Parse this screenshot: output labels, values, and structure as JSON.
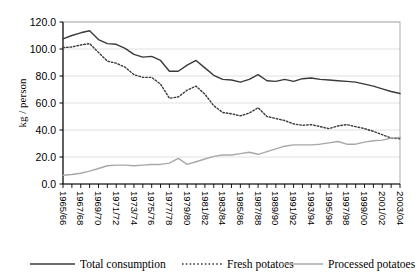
{
  "chart_data": {
    "type": "line",
    "title": "",
    "xlabel": "",
    "ylabel": "kg / person",
    "ylim": [
      0,
      120
    ],
    "ytick_values": [
      0,
      20,
      40,
      60,
      80,
      100,
      120
    ],
    "ytick_labels": [
      "0.0",
      "20.0",
      "40.0",
      "60.0",
      "80.0",
      "100.0",
      "120.0"
    ],
    "grid": true,
    "legend_position": "bottom",
    "x": [
      "1965/66",
      "1966/67",
      "1967/68",
      "1968/69",
      "1969/70",
      "1970/71",
      "1971/72",
      "1972/73",
      "1973/74",
      "1974/75",
      "1975/76",
      "1976/77",
      "1977/78",
      "1978/79",
      "1979/80",
      "1980/81",
      "1981/82",
      "1982/83",
      "1983/84",
      "1984/85",
      "1985/86",
      "1986/87",
      "1987/88",
      "1988/89",
      "1989/90",
      "1990/91",
      "1991/92",
      "1992/93",
      "1993/94",
      "1994/95",
      "1995/96",
      "1996/97",
      "1997/98",
      "1998/99",
      "1999/00",
      "2000/01",
      "2001/02",
      "2002/03",
      "2003/04"
    ],
    "xtick_labels": [
      "1965/66",
      "1967/68",
      "1969/70",
      "1971/72",
      "1973/74",
      "1975/76",
      "1977/78",
      "1979/80",
      "1981/82",
      "1983/84",
      "1985/86",
      "1987/88",
      "1989/90",
      "1991/92",
      "1993/94",
      "1995/96",
      "1997/98",
      "1999/00",
      "2001/02",
      "2003/04"
    ],
    "series": [
      {
        "name": "Total consumption",
        "style": "solid",
        "color": "#3a3a3a",
        "width": 1.4,
        "values": [
          107.5,
          110.0,
          112.0,
          113.5,
          107.0,
          104.0,
          103.5,
          100.5,
          96.0,
          94.0,
          94.5,
          91.5,
          83.5,
          83.5,
          88.0,
          91.5,
          86.0,
          80.5,
          77.5,
          77.0,
          75.5,
          77.5,
          81.0,
          76.5,
          76.0,
          77.5,
          76.0,
          78.0,
          78.5,
          77.5,
          77.0,
          76.5,
          76.0,
          75.5,
          74.0,
          72.5,
          70.5,
          68.5,
          67.0
        ]
      },
      {
        "name": "Fresh potatoes",
        "style": "dotted",
        "color": "#3a3a3a",
        "width": 1.4,
        "values": [
          101.0,
          101.5,
          103.0,
          104.0,
          97.5,
          91.0,
          89.5,
          86.5,
          81.0,
          79.0,
          79.0,
          74.0,
          63.5,
          64.5,
          69.5,
          72.5,
          66.5,
          58.0,
          53.0,
          52.0,
          50.5,
          52.5,
          56.5,
          50.0,
          48.5,
          47.0,
          44.5,
          43.5,
          44.0,
          42.5,
          41.0,
          43.0,
          44.0,
          42.5,
          41.0,
          39.0,
          36.5,
          34.0,
          33.5
        ]
      },
      {
        "name": "Processed potatoes",
        "style": "solid",
        "color": "#a8a8a8",
        "width": 1.4,
        "values": [
          6.5,
          7.0,
          8.0,
          9.5,
          11.5,
          13.5,
          14.0,
          14.0,
          13.5,
          14.0,
          14.5,
          14.5,
          15.5,
          19.0,
          14.5,
          16.5,
          18.5,
          20.5,
          21.5,
          21.5,
          22.5,
          23.5,
          22.0,
          24.0,
          26.0,
          28.0,
          29.0,
          29.0,
          29.0,
          29.5,
          30.5,
          31.5,
          29.5,
          29.5,
          31.0,
          32.0,
          32.5,
          34.0,
          34.5
        ]
      }
    ]
  },
  "legend": {
    "items": [
      {
        "label": "Total consumption",
        "marker": "solid-dark"
      },
      {
        "label": "Fresh potatoes",
        "marker": "dotted-dark"
      },
      {
        "label": "Processed potatoes",
        "marker": "solid-gray"
      }
    ]
  },
  "colors": {
    "axis": "#000000",
    "grid": "#d9d9d9",
    "plot_border": "#9a9a9a",
    "total": "#3a3a3a",
    "fresh": "#3a3a3a",
    "processed": "#a8a8a8"
  }
}
